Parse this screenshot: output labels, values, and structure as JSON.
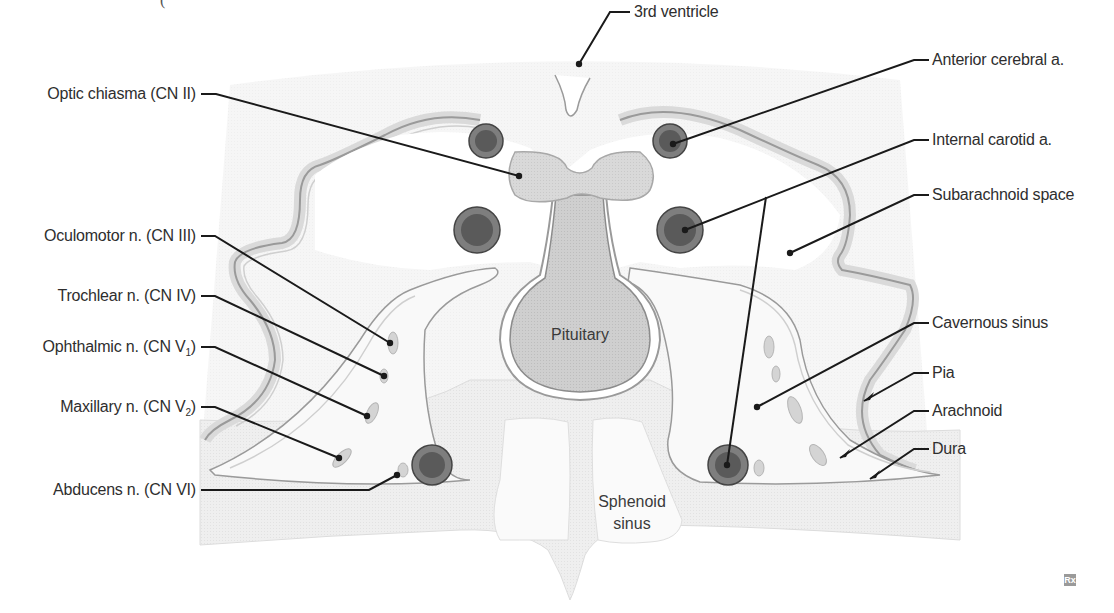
{
  "figure": {
    "title_fragment": "(upper cropped caption, not legible)",
    "watermark": "Rx",
    "colors": {
      "background": "#ffffff",
      "dura_fill": "#ececec",
      "tissue_light": "#f4f4f4",
      "membrane_line": "#9a9a9a",
      "pituitary_fill": "#c8c8c8",
      "chiasm_fill": "#d6d6d6",
      "artery_outer": "#8a8a8a",
      "artery_inner": "#555555",
      "nerve_fill": "#d2d2d2",
      "leader_line": "#1a1a1a",
      "label_text": "#2e2e2e"
    }
  },
  "labels_left": [
    {
      "id": "optic-chiasma",
      "text": "Optic chiasma (CN II)"
    },
    {
      "id": "oculomotor",
      "text": "Oculomotor n. (CN III)"
    },
    {
      "id": "trochlear",
      "text": "Trochlear n. (CN IV)"
    },
    {
      "id": "ophthalmic",
      "text": "Ophthalmic n. (CN V",
      "sub": "1",
      "close": ")"
    },
    {
      "id": "maxillary",
      "text": "Maxillary n. (CN V",
      "sub": "2",
      "close": ")"
    },
    {
      "id": "abducens",
      "text": "Abducens n. (CN VI)"
    }
  ],
  "labels_top": [
    {
      "id": "third-ventricle",
      "text": "3rd ventricle"
    }
  ],
  "labels_right": [
    {
      "id": "anterior-cerebral",
      "text": "Anterior cerebral a."
    },
    {
      "id": "internal-carotid",
      "text": "Internal carotid a."
    },
    {
      "id": "subarachnoid",
      "text": "Subarachnoid space"
    },
    {
      "id": "cavernous-sinus",
      "text": "Cavernous sinus"
    },
    {
      "id": "pia",
      "text": "Pia"
    },
    {
      "id": "arachnoid",
      "text": "Arachnoid"
    },
    {
      "id": "dura",
      "text": "Dura"
    }
  ],
  "labels_inline": [
    {
      "id": "pituitary",
      "text": "Pituitary"
    },
    {
      "id": "sphenoid-line1",
      "text": "Sphenoid"
    },
    {
      "id": "sphenoid-line2",
      "text": "sinus"
    }
  ]
}
